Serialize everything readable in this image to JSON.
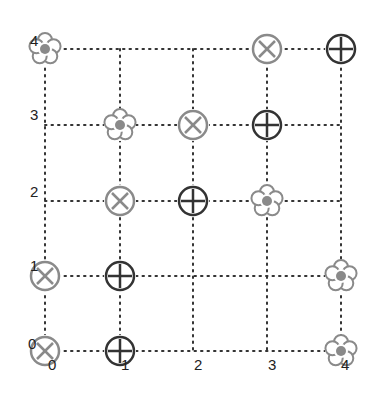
{
  "diagram": {
    "type": "grid",
    "columns": 5,
    "rows": 5,
    "x_labels": [
      "0",
      "1",
      "2",
      "3",
      "4"
    ],
    "y_labels": [
      "0",
      "1",
      "2",
      "3",
      "4"
    ],
    "colors": {
      "grid_dots": "#333333",
      "light_marker": "#8a8a8a",
      "dark_marker": "#333333",
      "flower_center": "#8a8a8a"
    },
    "nodes": [
      {
        "col": 0,
        "row": 4,
        "marker": "flower"
      },
      {
        "col": 3,
        "row": 4,
        "marker": "circle-x"
      },
      {
        "col": 4,
        "row": 4,
        "marker": "circle-plus"
      },
      {
        "col": 1,
        "row": 3,
        "marker": "flower"
      },
      {
        "col": 2,
        "row": 3,
        "marker": "circle-x"
      },
      {
        "col": 3,
        "row": 3,
        "marker": "circle-plus"
      },
      {
        "col": 1,
        "row": 2,
        "marker": "circle-x"
      },
      {
        "col": 2,
        "row": 2,
        "marker": "circle-plus"
      },
      {
        "col": 3,
        "row": 2,
        "marker": "flower"
      },
      {
        "col": 0,
        "row": 1,
        "marker": "circle-x"
      },
      {
        "col": 1,
        "row": 1,
        "marker": "circle-plus"
      },
      {
        "col": 4,
        "row": 1,
        "marker": "flower"
      },
      {
        "col": 0,
        "row": 0,
        "marker": "circle-x"
      },
      {
        "col": 1,
        "row": 0,
        "marker": "circle-plus"
      },
      {
        "col": 4,
        "row": 0,
        "marker": "flower"
      }
    ]
  }
}
